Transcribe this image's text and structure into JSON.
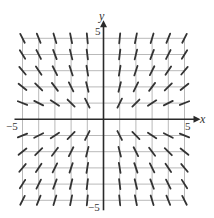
{
  "diagram": {
    "type": "slope_field",
    "equation_estimate": "dy/dx = 2y/x",
    "x_axis": {
      "label": "x",
      "min_label": "−5",
      "max_label": "5",
      "range": [
        -5,
        5
      ]
    },
    "y_axis": {
      "label": "y",
      "min_label": "−5",
      "max_label": "5",
      "range": [
        -5,
        5
      ]
    },
    "grid_step": 1,
    "colors": {
      "grid": "#b9b9b9",
      "axis": "#2a2a2a",
      "segment": "#333333",
      "background": "#ffffff"
    },
    "layout": {
      "origin_px": [
        103.5,
        119.3
      ],
      "unit_px": 16.2,
      "segment_length_px": 10
    }
  },
  "chart_data": {
    "type": "slope_field",
    "title": "",
    "xlabel": "x",
    "ylabel": "y",
    "xlim": [
      -5,
      5
    ],
    "ylim": [
      -5,
      5
    ],
    "tick_labels": {
      "x": [
        "−5",
        "5"
      ],
      "y": [
        "−5",
        "5"
      ]
    },
    "grid": true,
    "sample_points": "integer lattice x,y in [-5,5], excluding x=0 and y=0",
    "slope_function": "2*y/x"
  }
}
